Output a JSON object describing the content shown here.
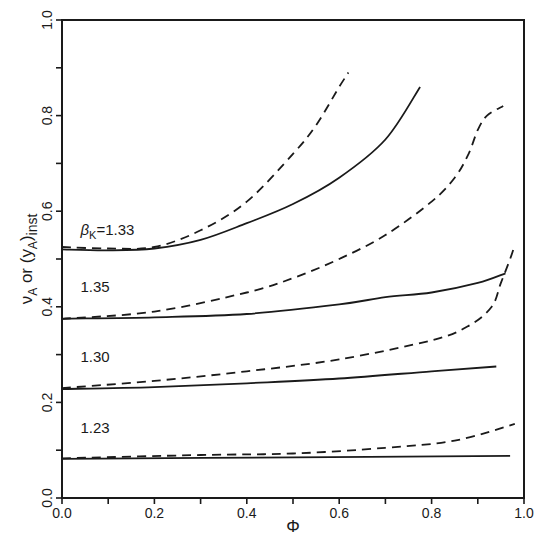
{
  "chart_data": {
    "type": "line",
    "title": "",
    "xlabel": "Φ",
    "ylabel": "ν_A or (y_A)_inst",
    "xlim": [
      0.0,
      1.0
    ],
    "ylim": [
      0.0,
      1.0
    ],
    "x_ticks": [
      "0.0",
      "0.2",
      "0.4",
      "0.6",
      "0.8",
      "1.0"
    ],
    "y_ticks": [
      "0.0",
      "0.2",
      "0.4",
      "0.6",
      "0.8",
      "1.0"
    ],
    "minor_ticks": true,
    "grid": false,
    "legend": "none (curves labeled inline)",
    "line_styles": {
      "solid": "ν_A",
      "dashed": "(y_A)_inst"
    },
    "labels": [
      {
        "text": "β",
        "sub": "K",
        "suffix": "=1.33",
        "x": 0.04,
        "y": 0.55
      },
      {
        "text": "1.35",
        "x": 0.04,
        "y": 0.43
      },
      {
        "text": "1.30",
        "x": 0.04,
        "y": 0.285
      },
      {
        "text": "1.23",
        "x": 0.04,
        "y": 0.135
      }
    ],
    "series": [
      {
        "name": "β_K=1.33 solid",
        "style": "solid",
        "x": [
          0.0,
          0.1,
          0.2,
          0.3,
          0.4,
          0.5,
          0.6,
          0.7,
          0.775
        ],
        "y": [
          0.52,
          0.518,
          0.522,
          0.54,
          0.575,
          0.615,
          0.67,
          0.75,
          0.86
        ]
      },
      {
        "name": "β_K=1.33 dashed",
        "style": "dashed",
        "x": [
          0.0,
          0.1,
          0.2,
          0.3,
          0.4,
          0.5,
          0.55,
          0.6,
          0.62
        ],
        "y": [
          0.525,
          0.522,
          0.525,
          0.56,
          0.62,
          0.72,
          0.78,
          0.86,
          0.89
        ]
      },
      {
        "name": "β_K=1.35 solid",
        "style": "solid",
        "x": [
          0.0,
          0.2,
          0.4,
          0.6,
          0.7,
          0.8,
          0.9,
          0.96
        ],
        "y": [
          0.375,
          0.378,
          0.385,
          0.405,
          0.42,
          0.43,
          0.45,
          0.47
        ]
      },
      {
        "name": "β_K=1.35 dashed",
        "style": "dashed",
        "x": [
          0.0,
          0.2,
          0.4,
          0.5,
          0.6,
          0.7,
          0.8,
          0.85,
          0.88,
          0.9,
          0.92,
          0.955
        ],
        "y": [
          0.375,
          0.39,
          0.43,
          0.46,
          0.5,
          0.55,
          0.62,
          0.67,
          0.72,
          0.77,
          0.8,
          0.82
        ]
      },
      {
        "name": "β_K=1.30 solid",
        "style": "solid",
        "x": [
          0.0,
          0.2,
          0.4,
          0.6,
          0.8,
          0.94
        ],
        "y": [
          0.228,
          0.232,
          0.24,
          0.25,
          0.265,
          0.275
        ]
      },
      {
        "name": "β_K=1.30 dashed",
        "style": "dashed",
        "x": [
          0.0,
          0.2,
          0.4,
          0.6,
          0.8,
          0.88,
          0.93,
          0.95,
          0.97,
          0.98
        ],
        "y": [
          0.23,
          0.245,
          0.265,
          0.29,
          0.33,
          0.36,
          0.4,
          0.45,
          0.5,
          0.53
        ]
      },
      {
        "name": "β_K=1.23 solid",
        "style": "solid",
        "x": [
          0.0,
          0.5,
          0.97
        ],
        "y": [
          0.082,
          0.085,
          0.088
        ]
      },
      {
        "name": "β_K=1.23 dashed",
        "style": "dashed",
        "x": [
          0.0,
          0.3,
          0.5,
          0.7,
          0.85,
          0.98
        ],
        "y": [
          0.083,
          0.09,
          0.093,
          0.105,
          0.12,
          0.155
        ]
      }
    ]
  },
  "axes": {
    "x_title": "Φ",
    "y_title_nu": "ν",
    "y_title_nu_sub": "A",
    "y_title_or": " or (y",
    "y_title_y_sub": "A",
    "y_title_close": ")",
    "y_title_inst_sub": "inst"
  }
}
